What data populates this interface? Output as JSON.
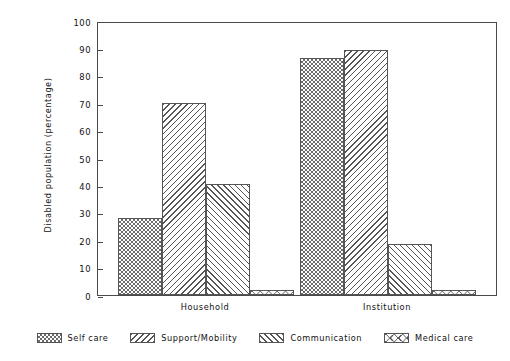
{
  "chart_data": {
    "type": "bar",
    "title": "",
    "subtitle": "",
    "xlabel": "",
    "ylabel": "Disabled population (percentage)",
    "categories": [
      "Household",
      "Institution"
    ],
    "series": [
      {
        "name": "Self care",
        "pattern": "checkerboard",
        "values": [
          28,
          86.5
        ]
      },
      {
        "name": "Support/Mobility",
        "pattern": "backslash-hatch",
        "values": [
          70,
          89.5
        ]
      },
      {
        "name": "Communication",
        "pattern": "forwardslash-hatch",
        "values": [
          40.5,
          18.5
        ]
      },
      {
        "name": "Medical care",
        "pattern": "bowtie-x",
        "values": [
          2,
          2
        ]
      }
    ],
    "ylim": [
      0,
      100
    ],
    "yticks": [
      0,
      10,
      20,
      30,
      40,
      50,
      60,
      70,
      80,
      90,
      100
    ],
    "ytick_labels": [
      "0",
      "10",
      "20",
      "30",
      "40",
      "50",
      "60",
      "70",
      "80",
      "90",
      "100"
    ],
    "grid": false,
    "legend_position": "bottom",
    "legend_entries": [
      "Self care",
      "Support/Mobility",
      "Communication",
      "Medical care"
    ],
    "colors": {
      "axis": "#4a4a4a",
      "hatch": "#555555",
      "text": "#111111",
      "background": "#ffffff"
    }
  }
}
